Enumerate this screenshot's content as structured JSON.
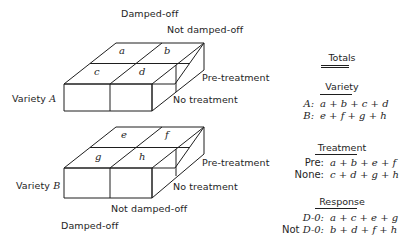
{
  "top_box": {
    "response_labels": {
      "damped_off": "Damped-off",
      "not_damped_off": "Not damped-off"
    },
    "treatment_labels": {
      "pre": "Pre-treatment",
      "none": "No treatment"
    },
    "variety_label": "Variety ",
    "variety_letter": "A",
    "cells": {
      "pre_damped": "a",
      "pre_not": "b",
      "none_damped": "c",
      "none_not": "d"
    }
  },
  "bottom_box": {
    "response_labels": {
      "damped_off": "Damped-off",
      "not_damped_off": "Not damped-off"
    },
    "treatment_labels": {
      "pre": "Pre-treatment",
      "none": "No treatment"
    },
    "variety_label": "Variety ",
    "variety_letter": "B",
    "cells": {
      "pre_damped": "e",
      "pre_not": "f",
      "none_damped": "g",
      "none_not": "h"
    }
  },
  "totals": {
    "title": "Totals",
    "sections": [
      {
        "heading": "Variety",
        "rows": [
          {
            "key": "A:",
            "key_italic": true,
            "expr": "a + b + c + d"
          },
          {
            "key": "B:",
            "key_italic": true,
            "expr": "e + f + g + h"
          }
        ]
      },
      {
        "heading": "Treatment",
        "rows": [
          {
            "key": "Pre:",
            "key_italic": false,
            "expr": "a + b + e + f"
          },
          {
            "key": "None:",
            "key_italic": false,
            "expr": "c + d + g + h"
          }
        ]
      },
      {
        "heading": "Response",
        "rows": [
          {
            "key": "D-0:",
            "key_italic": true,
            "expr": "a + c + e + g"
          },
          {
            "key_prefix": "Not ",
            "key": "D-0:",
            "key_italic": true,
            "expr": "b + d + f + h"
          }
        ]
      }
    ]
  }
}
